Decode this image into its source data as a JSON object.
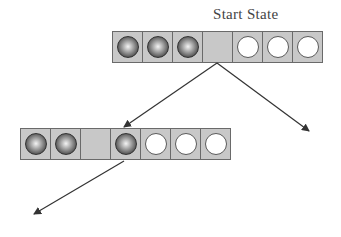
{
  "title": "Start State",
  "colors": {
    "cell_bg": "#c8c8c8",
    "border": "#6a6a6a",
    "arrow": "#333333"
  },
  "states": [
    {
      "name": "start-state",
      "cells": [
        "dark",
        "dark",
        "dark",
        "empty",
        "light",
        "light",
        "light"
      ]
    },
    {
      "name": "child-state",
      "cells": [
        "dark",
        "dark",
        "empty",
        "dark",
        "light",
        "light",
        "light"
      ]
    }
  ],
  "arrows": [
    {
      "from": [
        217,
        63
      ],
      "to": [
        124,
        127
      ]
    },
    {
      "from": [
        217,
        63
      ],
      "to": [
        309,
        131
      ]
    },
    {
      "from": [
        124,
        161
      ],
      "to": [
        34,
        214
      ]
    }
  ]
}
